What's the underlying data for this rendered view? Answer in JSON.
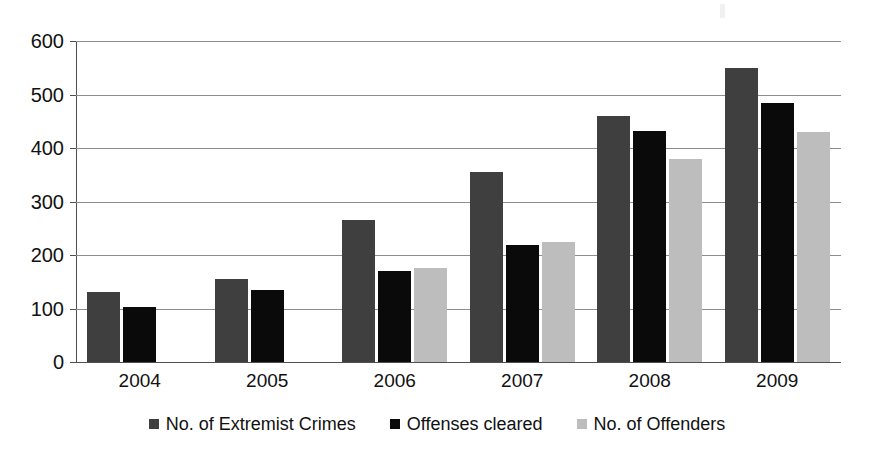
{
  "chart_data": {
    "type": "bar",
    "title": "",
    "subtitle": "",
    "xlabel": "",
    "ylabel": "",
    "categories": [
      "2004",
      "2005",
      "2006",
      "2007",
      "2008",
      "2009"
    ],
    "series": [
      {
        "name": "No. of Extremist Crimes",
        "color": "#3f3f3f",
        "values": [
          130,
          155,
          265,
          355,
          460,
          550
        ]
      },
      {
        "name": "Offenses cleared",
        "color": "#0a0a0a",
        "values": [
          103,
          134,
          170,
          218,
          432,
          485
        ]
      },
      {
        "name": "No. of Offenders",
        "color": "#bdbdbd",
        "values": [
          null,
          null,
          175,
          225,
          380,
          430
        ]
      }
    ],
    "ylim": [
      0,
      600
    ],
    "ytick_step": 100,
    "yticks": [
      "0",
      "100",
      "200",
      "300",
      "400",
      "500",
      "600"
    ],
    "grid": true,
    "legend_position": "bottom"
  }
}
